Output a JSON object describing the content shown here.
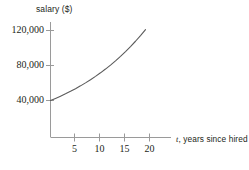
{
  "chart_data": {
    "type": "line",
    "title": "",
    "xlabel": "t, years since hired",
    "xlabel_var": "t",
    "xlabel_rest": ", years since hired",
    "ylabel": "salary ($)",
    "xlim": [
      0,
      24
    ],
    "ylim": [
      0,
      140000
    ],
    "grid": false,
    "legend": null,
    "xticks": [
      5,
      10,
      15,
      20
    ],
    "xtick_labels": [
      "5",
      "10",
      "15",
      "20"
    ],
    "yticks": [
      40000,
      80000,
      120000
    ],
    "ytick_labels": [
      "40,000",
      "80,000",
      "120,000"
    ],
    "series": [
      {
        "name": "salary",
        "x": [
          0,
          1,
          2,
          3,
          4,
          5,
          6,
          7,
          8,
          9,
          10,
          11,
          12,
          13,
          14,
          15,
          16,
          17,
          18,
          19
        ],
        "values": [
          40000,
          42400,
          44944,
          47641,
          50499,
          53529,
          56741,
          60145,
          63754,
          67579,
          71634,
          75932,
          80488,
          85317,
          90436,
          95862,
          101614,
          107711,
          114174,
          121024
        ]
      }
    ],
    "curve_color": "#5a5a5a",
    "axis_color": "#9a9a9a",
    "text_color": "#231f20",
    "background": "#ffffff"
  }
}
